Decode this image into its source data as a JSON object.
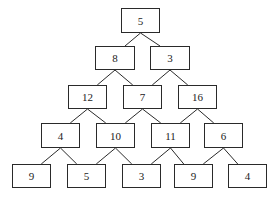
{
  "diagram": {
    "type": "number-pyramid",
    "rows": [
      [
        "5"
      ],
      [
        "8",
        "3"
      ],
      [
        "12",
        "7",
        "16"
      ],
      [
        "4",
        "10",
        "11",
        "6"
      ],
      [
        "9",
        "5",
        "3",
        "9",
        "4"
      ]
    ],
    "nodes": [
      {
        "id": "r0c0",
        "label": "5",
        "x": 121,
        "y": 8,
        "w": 39,
        "h": 25
      },
      {
        "id": "r1c0",
        "label": "8",
        "x": 95,
        "y": 46,
        "w": 40,
        "h": 24
      },
      {
        "id": "r1c1",
        "label": "3",
        "x": 150,
        "y": 46,
        "w": 40,
        "h": 24
      },
      {
        "id": "r2c0",
        "label": "12",
        "x": 68,
        "y": 85,
        "w": 39,
        "h": 24
      },
      {
        "id": "r2c1",
        "label": "7",
        "x": 123,
        "y": 85,
        "w": 39,
        "h": 24
      },
      {
        "id": "r2c2",
        "label": "16",
        "x": 178,
        "y": 85,
        "w": 39,
        "h": 24
      },
      {
        "id": "r3c0",
        "label": "4",
        "x": 41,
        "y": 123,
        "w": 39,
        "h": 25
      },
      {
        "id": "r3c1",
        "label": "10",
        "x": 96,
        "y": 123,
        "w": 39,
        "h": 25
      },
      {
        "id": "r3c2",
        "label": "11",
        "x": 151,
        "y": 123,
        "w": 39,
        "h": 25
      },
      {
        "id": "r3c3",
        "label": "6",
        "x": 204,
        "y": 123,
        "w": 39,
        "h": 25
      },
      {
        "id": "r4c0",
        "label": "9",
        "x": 12,
        "y": 164,
        "w": 39,
        "h": 24
      },
      {
        "id": "r4c1",
        "label": "5",
        "x": 67,
        "y": 164,
        "w": 39,
        "h": 24
      },
      {
        "id": "r4c2",
        "label": "3",
        "x": 122,
        "y": 164,
        "w": 39,
        "h": 24
      },
      {
        "id": "r4c3",
        "label": "9",
        "x": 174,
        "y": 164,
        "w": 39,
        "h": 24
      },
      {
        "id": "r4c4",
        "label": "4",
        "x": 228,
        "y": 164,
        "w": 39,
        "h": 24
      }
    ],
    "edges": [
      [
        "r0c0",
        "r1c0"
      ],
      [
        "r0c0",
        "r1c1"
      ],
      [
        "r1c0",
        "r2c0"
      ],
      [
        "r1c0",
        "r2c1"
      ],
      [
        "r1c1",
        "r2c1"
      ],
      [
        "r1c1",
        "r2c2"
      ],
      [
        "r2c0",
        "r3c0"
      ],
      [
        "r2c0",
        "r3c1"
      ],
      [
        "r2c1",
        "r3c1"
      ],
      [
        "r2c1",
        "r3c2"
      ],
      [
        "r2c2",
        "r3c2"
      ],
      [
        "r2c2",
        "r3c3"
      ],
      [
        "r3c0",
        "r4c0"
      ],
      [
        "r3c0",
        "r4c1"
      ],
      [
        "r3c1",
        "r4c1"
      ],
      [
        "r3c1",
        "r4c2"
      ],
      [
        "r3c2",
        "r4c2"
      ],
      [
        "r3c2",
        "r4c3"
      ],
      [
        "r3c3",
        "r4c3"
      ],
      [
        "r3c3",
        "r4c4"
      ]
    ],
    "colors": {
      "stroke": "#2a2a2a",
      "background": "#ffffff",
      "text": "#222222"
    }
  }
}
